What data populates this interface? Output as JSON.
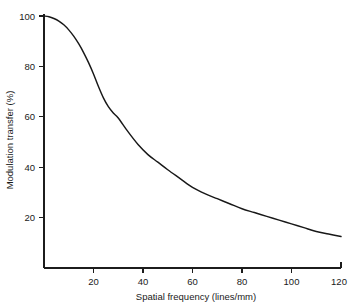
{
  "chart_data": {
    "type": "line",
    "title": "",
    "xlabel": "Spatial frequency (lines/mm)",
    "ylabel": "Modulation transfer (%)",
    "xlim": [
      0,
      120
    ],
    "ylim": [
      0,
      100
    ],
    "grid": false,
    "legend": "none",
    "xticks": [
      20,
      40,
      60,
      80,
      100,
      120
    ],
    "yticks": [
      20,
      40,
      60,
      80,
      100
    ],
    "xtick_labels": [
      "20",
      "40",
      "60",
      "80",
      "100",
      "120"
    ],
    "ytick_labels": [
      "20",
      "40",
      "60",
      "80",
      "100"
    ],
    "series": [
      {
        "name": "Modulation transfer function",
        "x": [
          0,
          2,
          4,
          6,
          8,
          10,
          12,
          14,
          16,
          18,
          20,
          22,
          24,
          26,
          28,
          30,
          34,
          38,
          42,
          46,
          50,
          55,
          60,
          65,
          70,
          75,
          80,
          85,
          90,
          95,
          100,
          105,
          110,
          115,
          120
        ],
        "values": [
          100,
          99.7,
          99,
          98,
          96.5,
          94.5,
          92,
          89,
          85.5,
          81.5,
          77,
          72,
          67.5,
          64,
          61.5,
          59.5,
          54,
          49,
          45,
          42,
          39,
          35.5,
          32,
          29.5,
          27.5,
          25.5,
          23.5,
          22,
          20.5,
          19,
          17.5,
          16,
          14.5,
          13.5,
          12.5
        ]
      }
    ]
  },
  "figure": {
    "background_color": "#ffffff",
    "line_color": "#181818",
    "axis_color": "#1c1c1c"
  }
}
